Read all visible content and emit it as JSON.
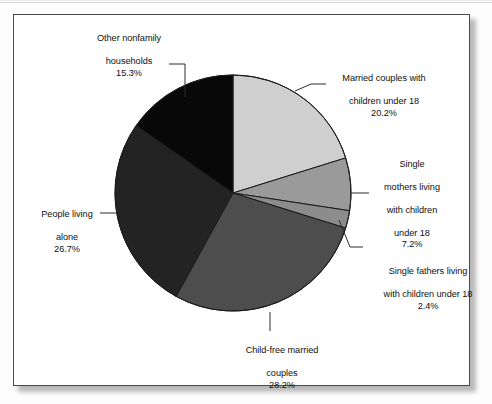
{
  "chart_data": {
    "type": "pie",
    "title": "",
    "subtitle": "",
    "xlabel": "",
    "ylabel": "",
    "legend_position": "none",
    "labels_position": "outside-with-leader-lines",
    "grid": false,
    "categories": [
      "Married couples with children under 18",
      "Single mothers living with children under 18",
      "Single fathers living with children under 18",
      "Child-free married couples",
      "People living alone",
      "Other nonfamily households"
    ],
    "values": [
      20.2,
      7.2,
      2.4,
      28.2,
      26.7,
      15.3
    ],
    "units": "%",
    "start_angle_deg": 0,
    "direction": "clockwise",
    "slices": [
      {
        "key": "married_with_children",
        "line1": "Married couples with",
        "line2": "children under 18",
        "label": "Married couples with children under 18",
        "value": 20.2,
        "pct_text": "20.2%",
        "color": "#cfcfcf"
      },
      {
        "key": "single_mothers",
        "line1": "Single",
        "line2": "mothers living",
        "line3": "with children",
        "line4": "under 18",
        "label": "Single mothers living with children under 18",
        "value": 7.2,
        "pct_text": "7.2%",
        "color": "#9a9a9a"
      },
      {
        "key": "single_fathers",
        "line1": "Single fathers living",
        "line2": "with children under 18",
        "label": "Single fathers living with children under 18",
        "value": 2.4,
        "pct_text": "2.4%",
        "color": "#8c8c8c"
      },
      {
        "key": "child_free_married",
        "line1": "Child-free married",
        "line2": "couples",
        "label": "Child-free married couples",
        "value": 28.2,
        "pct_text": "28.2%",
        "color": "#4d4d4d"
      },
      {
        "key": "people_living_alone",
        "line1": "People living",
        "line2": "alone",
        "label": "People living alone",
        "value": 26.7,
        "pct_text": "26.7%",
        "color": "#232323"
      },
      {
        "key": "other_nonfamily",
        "line1": "Other nonfamily",
        "line2": "households",
        "label": "Other nonfamily households",
        "value": 15.3,
        "pct_text": "15.3%",
        "color": "#080808"
      }
    ]
  },
  "figure": {
    "border_color": "#4a4a4a",
    "background": "#ffffff",
    "leader_line_color": "#2b2b2b",
    "slice_outline_color": "#1a1a1a"
  }
}
